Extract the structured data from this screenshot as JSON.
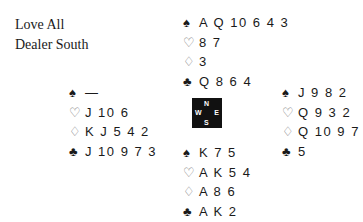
{
  "deal_info": {
    "vulnerability": "Love All",
    "dealer": "Dealer South"
  },
  "suit_symbols": {
    "spades": "♠",
    "hearts": "♡",
    "diamonds": "♢",
    "clubs": "♣"
  },
  "compass": {
    "north": "N",
    "south": "S",
    "west": "W",
    "east": "E"
  },
  "hands": {
    "north": {
      "spades": "A Q 10 6 4 3",
      "hearts": "8 7",
      "diamonds": "3",
      "clubs": "Q 8 6 4"
    },
    "west": {
      "spades": "—",
      "hearts": "J 10 6",
      "diamonds": "K J 5 4 2",
      "clubs": "J 10 9 7 3"
    },
    "east": {
      "spades": "J 9 8 2",
      "hearts": "Q 9 3 2",
      "diamonds": "Q 10 9 7",
      "clubs": "5"
    },
    "south": {
      "spades": "K 7 5",
      "hearts": "A K 5 4",
      "diamonds": "A 8 6",
      "clubs": "A K 2"
    }
  }
}
